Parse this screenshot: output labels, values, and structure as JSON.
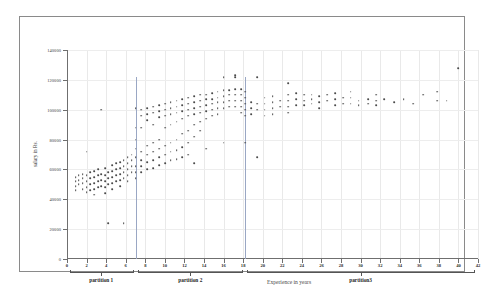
{
  "chart_data": {
    "type": "scatter",
    "title": "",
    "xlabel": "Experience in years",
    "ylabel": "salary in Rs.",
    "xlim": [
      0,
      42
    ],
    "ylim": [
      0,
      140000
    ],
    "grid": true,
    "legend": "none",
    "x_ticks": [
      0,
      2,
      4,
      6,
      8,
      10,
      12,
      14,
      16,
      18,
      20,
      22,
      24,
      26,
      28,
      30,
      32,
      34,
      36,
      38,
      40,
      42
    ],
    "y_ticks": [
      0,
      20000,
      40000,
      60000,
      80000,
      100000,
      120000,
      140000
    ],
    "x_tick_labels": [
      "0",
      "2",
      "4",
      "6",
      "8",
      "10",
      "12",
      "14",
      "16",
      "18",
      "20",
      "22",
      "24",
      "26",
      "28",
      "30",
      "32",
      "34",
      "36",
      "38",
      "40",
      "42"
    ],
    "y_tick_labels": [
      "0",
      "20000",
      "40000",
      "60000",
      "80000",
      "100000",
      "120000",
      "140000"
    ],
    "point_color": "#4a4a4a",
    "divider_color": "#9aa7c4",
    "partition_dividers": [
      7.0,
      18.2
    ],
    "partitions": [
      {
        "label": "partition 1",
        "start": 0.3,
        "end": 6.8,
        "center": 3.5
      },
      {
        "label": "partition 2",
        "start": 7.3,
        "end": 18.0,
        "center": 12.6
      },
      {
        "label": "partition3",
        "start": 18.4,
        "end": 41.7,
        "center": 30.0
      }
    ],
    "points": [
      [
        0.9,
        55000
      ],
      [
        0.9,
        52000
      ],
      [
        0.9,
        49000
      ],
      [
        0.9,
        46000
      ],
      [
        1.2,
        56000
      ],
      [
        1.2,
        53000
      ],
      [
        1.2,
        50000
      ],
      [
        1.6,
        57000
      ],
      [
        1.6,
        54000
      ],
      [
        1.6,
        51000
      ],
      [
        1.6,
        47000
      ],
      [
        2.0,
        72000
      ],
      [
        2.0,
        56000
      ],
      [
        2.0,
        52000
      ],
      [
        2.0,
        48000
      ],
      [
        2.0,
        45000
      ],
      [
        2.4,
        58000
      ],
      [
        2.4,
        54000
      ],
      [
        2.4,
        50000
      ],
      [
        2.4,
        46000
      ],
      [
        2.8,
        59000
      ],
      [
        2.8,
        55000
      ],
      [
        2.8,
        51000
      ],
      [
        2.8,
        47000
      ],
      [
        2.8,
        43000
      ],
      [
        3.2,
        60000
      ],
      [
        3.2,
        56000
      ],
      [
        3.2,
        52000
      ],
      [
        3.2,
        48000
      ],
      [
        3.5,
        100000
      ],
      [
        3.5,
        57000
      ],
      [
        3.5,
        53000
      ],
      [
        3.5,
        49000
      ],
      [
        3.9,
        61000
      ],
      [
        3.9,
        56000
      ],
      [
        3.9,
        52000
      ],
      [
        3.9,
        48000
      ],
      [
        3.9,
        44000
      ],
      [
        4.2,
        24000
      ],
      [
        4.2,
        58000
      ],
      [
        4.2,
        54000
      ],
      [
        4.2,
        50000
      ],
      [
        4.6,
        63000
      ],
      [
        4.6,
        59000
      ],
      [
        4.6,
        55000
      ],
      [
        4.6,
        51000
      ],
      [
        4.6,
        47000
      ],
      [
        5.0,
        64000
      ],
      [
        5.0,
        60000
      ],
      [
        5.0,
        56000
      ],
      [
        5.0,
        52000
      ],
      [
        5.4,
        65000
      ],
      [
        5.4,
        61000
      ],
      [
        5.4,
        57000
      ],
      [
        5.4,
        53000
      ],
      [
        5.4,
        49000
      ],
      [
        5.8,
        24000
      ],
      [
        5.8,
        66000
      ],
      [
        5.8,
        62000
      ],
      [
        5.8,
        58000
      ],
      [
        5.8,
        54000
      ],
      [
        6.2,
        68000
      ],
      [
        6.2,
        64000
      ],
      [
        6.2,
        60000
      ],
      [
        6.2,
        56000
      ],
      [
        6.2,
        52000
      ],
      [
        6.6,
        70000
      ],
      [
        6.6,
        66000
      ],
      [
        6.6,
        62000
      ],
      [
        6.6,
        58000
      ],
      [
        7.0,
        101000
      ],
      [
        7.0,
        88000
      ],
      [
        7.0,
        80000
      ],
      [
        7.0,
        74000
      ],
      [
        7.0,
        68000
      ],
      [
        7.0,
        62000
      ],
      [
        7.0,
        58000
      ],
      [
        7.0,
        54000
      ],
      [
        7.6,
        100000
      ],
      [
        7.6,
        96000
      ],
      [
        7.6,
        88000
      ],
      [
        7.6,
        72000
      ],
      [
        7.6,
        66000
      ],
      [
        7.6,
        62000
      ],
      [
        7.6,
        58000
      ],
      [
        8.2,
        101000
      ],
      [
        8.2,
        97000
      ],
      [
        8.2,
        93000
      ],
      [
        8.2,
        76000
      ],
      [
        8.2,
        70000
      ],
      [
        8.2,
        65000
      ],
      [
        8.2,
        60000
      ],
      [
        8.8,
        102000
      ],
      [
        8.8,
        98000
      ],
      [
        8.8,
        90000
      ],
      [
        8.8,
        78000
      ],
      [
        8.8,
        72000
      ],
      [
        8.8,
        66000
      ],
      [
        8.8,
        61000
      ],
      [
        9.4,
        103000
      ],
      [
        9.4,
        99000
      ],
      [
        9.4,
        95000
      ],
      [
        9.4,
        80000
      ],
      [
        9.4,
        74000
      ],
      [
        9.4,
        68000
      ],
      [
        9.4,
        63000
      ],
      [
        10.0,
        104000
      ],
      [
        10.0,
        100000
      ],
      [
        10.0,
        96000
      ],
      [
        10.0,
        88000
      ],
      [
        10.0,
        76000
      ],
      [
        10.0,
        70000
      ],
      [
        10.0,
        64000
      ],
      [
        10.6,
        105000
      ],
      [
        10.6,
        101000
      ],
      [
        10.6,
        97000
      ],
      [
        10.6,
        90000
      ],
      [
        10.6,
        78000
      ],
      [
        10.6,
        72000
      ],
      [
        10.6,
        66000
      ],
      [
        11.2,
        106000
      ],
      [
        11.2,
        102000
      ],
      [
        11.2,
        98000
      ],
      [
        11.2,
        92000
      ],
      [
        11.2,
        80000
      ],
      [
        11.2,
        73000
      ],
      [
        11.2,
        67000
      ],
      [
        11.8,
        107000
      ],
      [
        11.8,
        103000
      ],
      [
        11.8,
        99000
      ],
      [
        11.8,
        94000
      ],
      [
        11.8,
        84000
      ],
      [
        11.8,
        75000
      ],
      [
        11.8,
        68000
      ],
      [
        12.4,
        108000
      ],
      [
        12.4,
        104000
      ],
      [
        12.4,
        100000
      ],
      [
        12.4,
        96000
      ],
      [
        12.4,
        86000
      ],
      [
        12.4,
        78000
      ],
      [
        12.4,
        70000
      ],
      [
        13.0,
        109000
      ],
      [
        13.0,
        105000
      ],
      [
        13.0,
        101000
      ],
      [
        13.0,
        97000
      ],
      [
        13.0,
        90000
      ],
      [
        13.0,
        82000
      ],
      [
        13.0,
        64000
      ],
      [
        13.6,
        110000
      ],
      [
        13.6,
        106000
      ],
      [
        13.6,
        102000
      ],
      [
        13.6,
        98000
      ],
      [
        13.6,
        92000
      ],
      [
        13.6,
        86000
      ],
      [
        14.2,
        110000
      ],
      [
        14.2,
        107000
      ],
      [
        14.2,
        103000
      ],
      [
        14.2,
        99000
      ],
      [
        14.2,
        94000
      ],
      [
        14.2,
        74000
      ],
      [
        14.8,
        111000
      ],
      [
        14.8,
        107000
      ],
      [
        14.8,
        104000
      ],
      [
        14.8,
        100000
      ],
      [
        14.8,
        96000
      ],
      [
        15.4,
        112000
      ],
      [
        15.4,
        108000
      ],
      [
        15.4,
        105000
      ],
      [
        15.4,
        101000
      ],
      [
        15.4,
        97000
      ],
      [
        16.0,
        122000
      ],
      [
        16.0,
        113000
      ],
      [
        16.0,
        109000
      ],
      [
        16.0,
        105000
      ],
      [
        16.0,
        101000
      ],
      [
        16.0,
        78000
      ],
      [
        16.6,
        113000
      ],
      [
        16.6,
        110000
      ],
      [
        16.6,
        106000
      ],
      [
        16.6,
        102000
      ],
      [
        17.2,
        122000
      ],
      [
        17.2,
        123000
      ],
      [
        17.2,
        114000
      ],
      [
        17.2,
        110000
      ],
      [
        17.2,
        106000
      ],
      [
        17.2,
        102000
      ],
      [
        17.8,
        114000
      ],
      [
        17.8,
        110000
      ],
      [
        17.8,
        106000
      ],
      [
        17.8,
        102000
      ],
      [
        17.8,
        98000
      ],
      [
        18.2,
        112000
      ],
      [
        18.2,
        108000
      ],
      [
        18.2,
        104000
      ],
      [
        18.2,
        100000
      ],
      [
        18.2,
        96000
      ],
      [
        18.2,
        78000
      ],
      [
        18.8,
        105000
      ],
      [
        18.8,
        101000
      ],
      [
        18.8,
        97000
      ],
      [
        19.4,
        122000
      ],
      [
        19.4,
        104000
      ],
      [
        19.4,
        100000
      ],
      [
        19.4,
        68000
      ],
      [
        20.2,
        108000
      ],
      [
        20.2,
        104000
      ],
      [
        20.2,
        100000
      ],
      [
        20.2,
        96000
      ],
      [
        21.0,
        109000
      ],
      [
        21.0,
        105000
      ],
      [
        21.0,
        101000
      ],
      [
        21.0,
        97000
      ],
      [
        21.8,
        106000
      ],
      [
        21.8,
        102000
      ],
      [
        22.6,
        118000
      ],
      [
        22.6,
        110000
      ],
      [
        22.6,
        106000
      ],
      [
        22.6,
        102000
      ],
      [
        22.6,
        98000
      ],
      [
        23.4,
        111000
      ],
      [
        23.4,
        107000
      ],
      [
        23.4,
        103000
      ],
      [
        24.2,
        110000
      ],
      [
        24.2,
        106000
      ],
      [
        24.2,
        103000
      ],
      [
        25.0,
        110000
      ],
      [
        25.0,
        107000
      ],
      [
        25.0,
        104000
      ],
      [
        25.8,
        109000
      ],
      [
        25.8,
        105000
      ],
      [
        25.8,
        101000
      ],
      [
        26.6,
        110000
      ],
      [
        26.6,
        106000
      ],
      [
        27.4,
        111000
      ],
      [
        27.4,
        107000
      ],
      [
        27.4,
        103000
      ],
      [
        28.2,
        108000
      ],
      [
        28.2,
        104000
      ],
      [
        29.0,
        112000
      ],
      [
        29.0,
        108000
      ],
      [
        29.0,
        104000
      ],
      [
        29.8,
        106000
      ],
      [
        29.8,
        103000
      ],
      [
        30.8,
        107000
      ],
      [
        30.8,
        104000
      ],
      [
        31.6,
        110000
      ],
      [
        31.6,
        106000
      ],
      [
        31.6,
        103000
      ],
      [
        32.4,
        107000
      ],
      [
        33.4,
        105000
      ],
      [
        34.4,
        107000
      ],
      [
        35.4,
        104000
      ],
      [
        36.4,
        110000
      ],
      [
        37.8,
        112000
      ],
      [
        37.8,
        106000
      ],
      [
        38.8,
        106000
      ],
      [
        40.0,
        128000
      ]
    ]
  }
}
